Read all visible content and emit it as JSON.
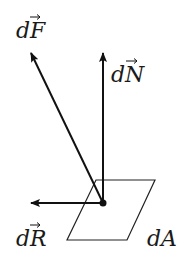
{
  "diagram": {
    "labels": {
      "force": "dF",
      "normal": "dN",
      "resultant": "dR",
      "area": "dA"
    },
    "colors": {
      "stroke": "#111111",
      "background": "#ffffff"
    }
  }
}
